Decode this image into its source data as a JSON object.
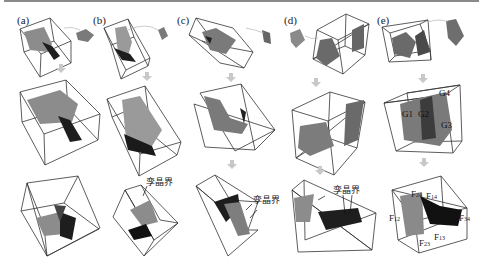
{
  "figure": {
    "panels": [
      {
        "id": "a",
        "label": "(a)"
      },
      {
        "id": "b",
        "label": "(b)"
      },
      {
        "id": "c",
        "label": "(c)"
      },
      {
        "id": "d",
        "label": "(d)"
      },
      {
        "id": "e",
        "label": "(e)"
      }
    ],
    "annotations": {
      "twin_boundary": "孪晶界",
      "grain_labels": [
        "G1",
        "G2",
        "G3",
        "G4"
      ],
      "face_labels": {
        "F24": {
          "base": "F",
          "sub": "24"
        },
        "F14": {
          "base": "F",
          "sub": "14"
        },
        "F12": {
          "base": "F",
          "sub": "12"
        },
        "F34": {
          "base": "F",
          "sub": "34"
        },
        "F23": {
          "base": "F",
          "sub": "23"
        },
        "F13": {
          "base": "F",
          "sub": "13"
        }
      }
    },
    "colors": {
      "frame_line": "#333333",
      "arrow": "#c8c8c8",
      "grain_light": "#9a9a9a",
      "grain_mid": "#6e6e6e",
      "grain_dark": "#1e1e1e",
      "top_rule": "#8a8a8a"
    }
  }
}
